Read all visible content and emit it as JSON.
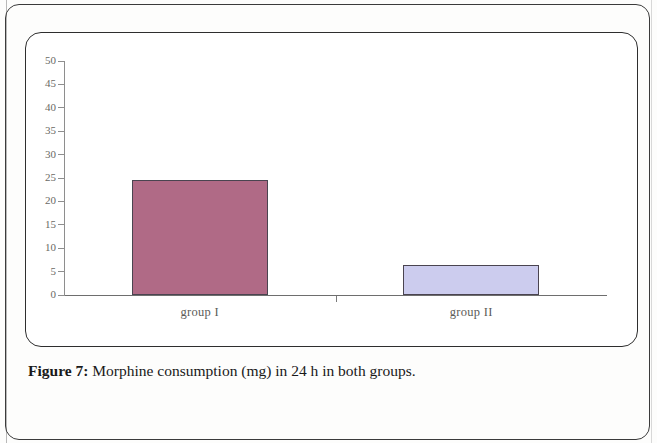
{
  "figure": {
    "label": "Figure 7:",
    "caption": " Morphine consumption (mg) in 24 h in both groups."
  },
  "colors": {
    "bar_group_i": "#b06a86",
    "bar_group_ii": "#ccccee",
    "bar_border": "#4a4450",
    "axis": "#8e8e8e",
    "frame": "#2e2e2e",
    "tick_label": "#6a6a64"
  },
  "chart_data": {
    "type": "bar",
    "title": "",
    "xlabel": "",
    "ylabel": "",
    "categories": [
      "group I",
      "group II"
    ],
    "values": [
      24.5,
      6.5
    ],
    "ylim": [
      0,
      50
    ],
    "ytick_step": 5,
    "yticks": [
      0,
      5,
      10,
      15,
      20,
      25,
      30,
      35,
      40,
      45,
      50
    ],
    "ytick_labels": [
      "0",
      "5",
      "10",
      "15",
      "20",
      "25",
      "30",
      "35",
      "40",
      "45",
      "50"
    ],
    "grid": false,
    "legend": false,
    "bar_colors": [
      "#b06a86",
      "#ccccee"
    ]
  }
}
